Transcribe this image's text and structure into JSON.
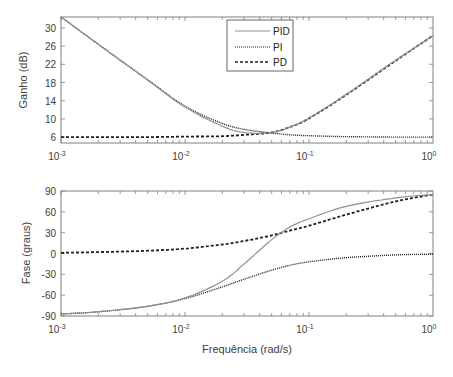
{
  "chart_data": [
    {
      "type": "line",
      "title": "",
      "xlabel": "",
      "ylabel": "Ganho (dB)",
      "xscale": "log",
      "xlim": [
        0.001,
        1
      ],
      "ylim": [
        4.7,
        32.4
      ],
      "x_ticks": [
        "10^-3",
        "10^-2",
        "10^-1",
        "10^0"
      ],
      "y_ticks": [
        6,
        10,
        14,
        18,
        22,
        26,
        30
      ],
      "grid": false,
      "legend_position": "upper center",
      "x": [
        0.001,
        0.002,
        0.005,
        0.01,
        0.02,
        0.03,
        0.05,
        0.07,
        0.1,
        0.2,
        0.5,
        1.0
      ],
      "series": [
        {
          "name": "PID",
          "style": "solid",
          "color": "#909090",
          "values": [
            32.4,
            26.4,
            18.5,
            12.6,
            8.4,
            7.0,
            7.0,
            8.2,
            10.2,
            15.4,
            22.9,
            28.3
          ]
        },
        {
          "name": "PI",
          "style": "dotted",
          "color": "#202020",
          "values": [
            32.4,
            26.4,
            18.6,
            12.8,
            9.0,
            7.7,
            6.9,
            6.5,
            6.3,
            6.1,
            6.0,
            6.0
          ]
        },
        {
          "name": "PD",
          "style": "dashed",
          "color": "#202020",
          "values": [
            6.0,
            6.0,
            6.0,
            6.1,
            6.2,
            6.5,
            7.0,
            8.2,
            10.1,
            15.3,
            22.8,
            28.3
          ]
        }
      ]
    },
    {
      "type": "line",
      "title": "",
      "xlabel": "Frequência (rad/s)",
      "ylabel": "Fase (graus)",
      "xscale": "log",
      "xlim": [
        0.001,
        1
      ],
      "ylim": [
        -90,
        90
      ],
      "x_ticks": [
        "10^-3",
        "10^-2",
        "10^-1",
        "10^0"
      ],
      "y_ticks": [
        90,
        60,
        30,
        0,
        -30,
        -60,
        -90
      ],
      "grid": false,
      "x": [
        0.001,
        0.002,
        0.005,
        0.01,
        0.02,
        0.03,
        0.05,
        0.07,
        0.1,
        0.2,
        0.5,
        1.0
      ],
      "series": [
        {
          "name": "PID",
          "style": "solid",
          "color": "#909090",
          "values": [
            -87,
            -84,
            -76,
            -64,
            -40,
            -15,
            20,
            38,
            50,
            68,
            80,
            85
          ]
        },
        {
          "name": "PI",
          "style": "dotted",
          "color": "#202020",
          "values": [
            -87,
            -84,
            -76,
            -65,
            -48,
            -37,
            -24,
            -17,
            -12,
            -6,
            -2,
            -1
          ]
        },
        {
          "name": "PD",
          "style": "dashed",
          "color": "#202020",
          "values": [
            1,
            2,
            4,
            7,
            13,
            18,
            26,
            33,
            40,
            56,
            75,
            85
          ]
        }
      ]
    }
  ],
  "gain_plot": {
    "ylabel": "Ganho (dB)",
    "y_ticks": [
      "30",
      "26",
      "22",
      "18",
      "14",
      "10",
      "6"
    ],
    "legend": [
      {
        "label": "PID"
      },
      {
        "label": "PI"
      },
      {
        "label": "PD"
      }
    ]
  },
  "phase_plot": {
    "ylabel": "Fase (graus)",
    "xlabel": "Frequência (rad/s)",
    "y_ticks": [
      "90",
      "60",
      "30",
      "0",
      "-30",
      "-60",
      "-90"
    ]
  },
  "x_ticks": [
    {
      "base": "10",
      "exp": "-3"
    },
    {
      "base": "10",
      "exp": "-2"
    },
    {
      "base": "10",
      "exp": "-1"
    },
    {
      "base": "10",
      "exp": "0"
    }
  ]
}
